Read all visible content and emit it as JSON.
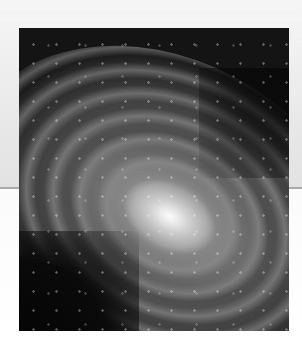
{
  "image": {
    "subject": "spiral-galaxy",
    "alt": "Spiral galaxy photograph",
    "colors": {
      "background_band": "#e9e9e9",
      "background_lower": "#ffffff",
      "divider_line": "#a9a9a9",
      "photo_frame": "#0d0d0d"
    }
  }
}
